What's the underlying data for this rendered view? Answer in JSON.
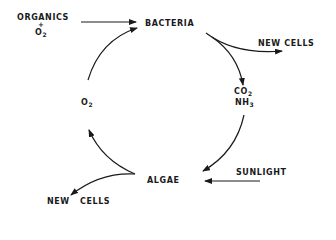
{
  "diagram": {
    "type": "cycle",
    "nodes": {
      "organics": {
        "label": "ORGANICS",
        "plus": "+",
        "o2": "O",
        "o2_sub": "2"
      },
      "bacteria": {
        "label": "BACTERIA"
      },
      "new_cells_bacteria": {
        "label": "NEW CELLS"
      },
      "co2": {
        "label": "CO",
        "sub": "2"
      },
      "nh3": {
        "label": "NH",
        "sub": "3"
      },
      "algae": {
        "label": "ALGAE"
      },
      "sunlight": {
        "label": "SUNLIGHT"
      },
      "new_cells_algae": {
        "label": "NEW   CELLS"
      },
      "o2_cycle": {
        "label": "O",
        "sub": "2"
      }
    },
    "edges": [
      {
        "from": "ORGANICS + O2",
        "to": "BACTERIA"
      },
      {
        "from": "BACTERIA",
        "to": "NEW CELLS"
      },
      {
        "from": "BACTERIA",
        "to": "CO2 NH3"
      },
      {
        "from": "CO2 NH3",
        "to": "ALGAE"
      },
      {
        "from": "SUNLIGHT",
        "to": "ALGAE"
      },
      {
        "from": "ALGAE",
        "to": "NEW CELLS"
      },
      {
        "from": "ALGAE",
        "to": "O2"
      },
      {
        "from": "O2",
        "to": "BACTERIA"
      }
    ],
    "colors": {
      "ink": "#1a1a1a",
      "background": "#ffffff"
    }
  }
}
